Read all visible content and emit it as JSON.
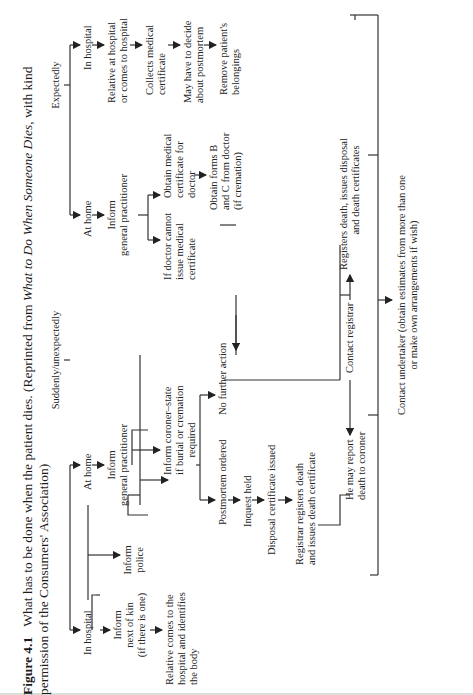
{
  "caption": {
    "label": "Figure 4.1",
    "text_1": "What has to be done when the patient dies. (Reprinted from ",
    "book_title": "What to Do When Someone Dies",
    "text_2": ", with kind",
    "line2": "permission of the Consumers' Association)"
  },
  "flowchart": {
    "sudden": {
      "header": "Suddenly/unexpectedly",
      "in_hospital": "In hospital",
      "inform_kin": [
        "Inform",
        "next of kin",
        "(if there is one)"
      ],
      "relative_identifies": [
        "Relative comes to the",
        "hospital and identifies",
        "the body"
      ],
      "at_home": "At home",
      "inform_police": [
        "Inform",
        "police"
      ],
      "inform_gp": [
        "Inform",
        "general practitioner"
      ],
      "inform_coroner": [
        "Inform coroner–state",
        "if burial or cremation",
        "required"
      ],
      "postmortem_ordered": "Postmortem ordered",
      "no_further_action": "No further action",
      "inquest_held": "Inquest held",
      "disposal_cert": "Disposal certificate issued",
      "registrar_registers": [
        "Registrar registers death",
        "and issues death certificate"
      ],
      "may_report": [
        "He may report",
        "death to coroner"
      ]
    },
    "expected": {
      "header": "Expectedly",
      "at_home": "At home",
      "inform_gp": [
        "Inform",
        "general practitioner"
      ],
      "doctor_cannot": [
        "If doctor cannot",
        "issue medical",
        "certificate"
      ],
      "obtain_cert": [
        "Obtain medical",
        "certificate for",
        "doctor"
      ],
      "obtain_forms": [
        "Obtain forms B",
        "and C from doctor",
        "(if cremation)"
      ],
      "in_hospital": "In hospital",
      "relative_at_hospital": [
        "Relative at hospital",
        "or comes to hospital"
      ],
      "collects_cert": [
        "Collects medical",
        "certificate"
      ],
      "decide_postmortem": [
        "May have to decide",
        "about postmortem"
      ],
      "remove_belongings": [
        "Remove patient's",
        "belongings"
      ]
    },
    "contact_registrar": "Contact registrar",
    "registers_death": [
      "Registers death, issues disposal",
      "and death certificates"
    ],
    "contact_undertaker": [
      "Contact undertaker (obtain estimates from more than one",
      "or make own arrangements if wish)"
    ]
  }
}
